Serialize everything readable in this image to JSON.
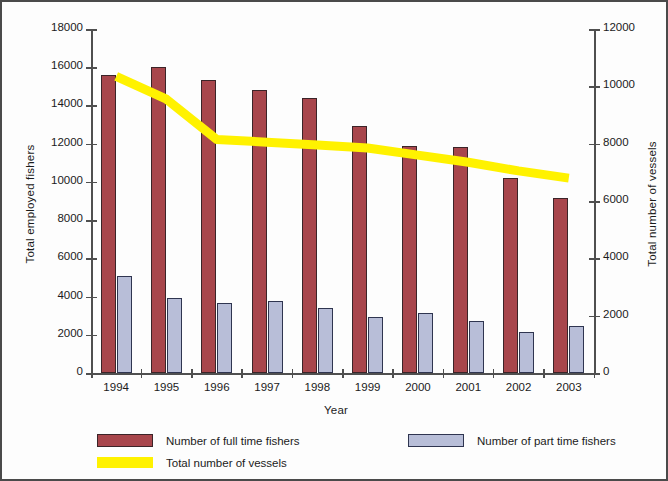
{
  "chart_data": {
    "type": "bar",
    "title": "",
    "xlabel": "Year",
    "ylabel": "Total employed fishers",
    "ylabel_right": "Total number of vessels",
    "categories": [
      "1994",
      "1995",
      "1996",
      "1997",
      "1998",
      "1999",
      "2000",
      "2001",
      "2002",
      "2003"
    ],
    "ylim": [
      0,
      18000
    ],
    "ylim_right": [
      0,
      12000
    ],
    "yticks": [
      "0",
      "2000",
      "4000",
      "6000",
      "8000",
      "10000",
      "12000",
      "14000",
      "16000",
      "18000"
    ],
    "yticks_right": [
      "0",
      "2000",
      "4000",
      "6000",
      "8000",
      "10000",
      "12000"
    ],
    "grid": false,
    "legend_position": "bottom",
    "series": [
      {
        "name": "Number of full time fishers",
        "type": "bar",
        "axis": "left",
        "color": "#a8464c",
        "values": [
          15600,
          16000,
          15350,
          14800,
          14400,
          12900,
          11900,
          11800,
          10200,
          9150
        ]
      },
      {
        "name": "Number of part time fishers",
        "type": "bar",
        "axis": "left",
        "color": "#b8bed8",
        "values": [
          5050,
          3900,
          3650,
          3750,
          3400,
          2950,
          3150,
          2700,
          2150,
          2450
        ]
      },
      {
        "name": "Total number of vessels",
        "type": "line",
        "axis": "right",
        "color": "#fff200",
        "values": [
          10350,
          9550,
          8150,
          8050,
          7950,
          7850,
          7600,
          7350,
          7050,
          6800
        ]
      }
    ]
  },
  "legend": {
    "items": [
      {
        "label": "Number of full time fishers",
        "swatch": "full-time-swatch"
      },
      {
        "label": "Number of part time fishers",
        "swatch": "part-time-swatch"
      },
      {
        "label": "Total number of vessels",
        "swatch": "vessels-swatch"
      }
    ]
  }
}
